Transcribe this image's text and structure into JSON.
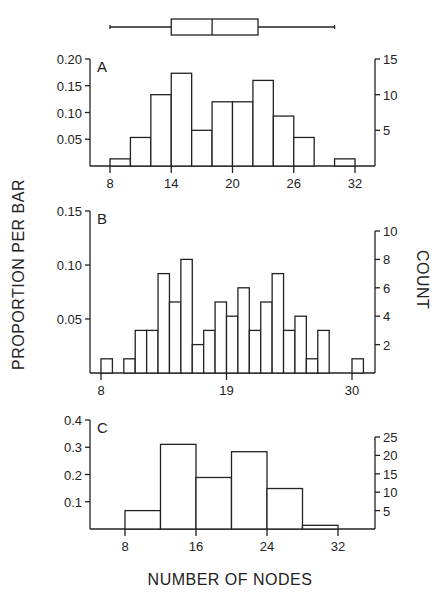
{
  "figure": {
    "ylabel_left": "PROPORTION PER BAR",
    "ylabel_right": "COUNT",
    "xlabel": "NUMBER OF NODES"
  },
  "boxplot": {
    "whisker_low": 8,
    "q1": 14,
    "median": 18,
    "q3": 22.5,
    "whisker_high": 30
  },
  "chart_data": [
    {
      "panel": "A",
      "type": "bar",
      "title": "A",
      "bin_width": 2,
      "bin_starts": [
        8,
        10,
        12,
        14,
        16,
        18,
        20,
        22,
        24,
        26,
        28,
        30
      ],
      "counts": [
        1,
        4,
        10,
        13,
        5,
        9,
        9,
        12,
        7,
        4,
        0,
        1
      ],
      "proportions": [
        0.013,
        0.053,
        0.133,
        0.173,
        0.067,
        0.12,
        0.12,
        0.16,
        0.093,
        0.053,
        0,
        0.013
      ],
      "xticks": [
        8,
        14,
        20,
        26,
        32
      ],
      "yticks_left": [
        "0.05",
        "0.10",
        "0.15",
        "0.20"
      ],
      "yticks_right": [
        "5",
        "10",
        "15"
      ],
      "ylim_left": [
        0,
        0.2
      ],
      "ylim_right": [
        0,
        15
      ],
      "xlabel": "NUMBER OF NODES",
      "ylabel": "PROPORTION PER BAR"
    },
    {
      "panel": "B",
      "type": "bar",
      "title": "B",
      "bin_width": 1,
      "bin_starts": [
        8,
        9,
        10,
        11,
        12,
        13,
        14,
        15,
        16,
        17,
        18,
        19,
        20,
        21,
        22,
        23,
        24,
        25,
        26,
        27,
        28,
        29,
        30
      ],
      "counts": [
        1,
        0,
        1,
        3,
        3,
        7,
        5,
        8,
        2,
        3,
        5,
        4,
        6,
        3,
        5,
        7,
        3,
        4,
        1,
        3,
        0,
        0,
        1
      ],
      "proportions": [
        0.013,
        0,
        0.013,
        0.04,
        0.04,
        0.093,
        0.067,
        0.107,
        0.027,
        0.04,
        0.067,
        0.053,
        0.08,
        0.04,
        0.067,
        0.093,
        0.04,
        0.053,
        0.013,
        0.04,
        0,
        0,
        0.013
      ],
      "xticks": [
        8,
        19,
        30
      ],
      "yticks_left": [
        "0.05",
        "0.10",
        "0.15"
      ],
      "yticks_right": [
        "2",
        "4",
        "6",
        "8",
        "10"
      ],
      "ylim_left": [
        0,
        0.15
      ],
      "ylim_right": [
        0,
        10
      ],
      "xlabel": "NUMBER OF NODES",
      "ylabel": "PROPORTION PER BAR"
    },
    {
      "panel": "C",
      "type": "bar",
      "title": "C",
      "bin_width": 4,
      "bin_starts": [
        8,
        12,
        16,
        20,
        24,
        28
      ],
      "counts": [
        5,
        23,
        14,
        21,
        11,
        1
      ],
      "proportions": [
        0.067,
        0.307,
        0.187,
        0.28,
        0.147,
        0.013
      ],
      "xticks": [
        8,
        16,
        24,
        32
      ],
      "yticks_left": [
        "0.1",
        "0.2",
        "0.3",
        "0.4"
      ],
      "yticks_right": [
        "5",
        "10",
        "15",
        "20",
        "25"
      ],
      "ylim_left": [
        0,
        0.4
      ],
      "ylim_right": [
        0,
        25
      ],
      "xlabel": "NUMBER OF NODES",
      "ylabel": "PROPORTION PER BAR"
    }
  ]
}
